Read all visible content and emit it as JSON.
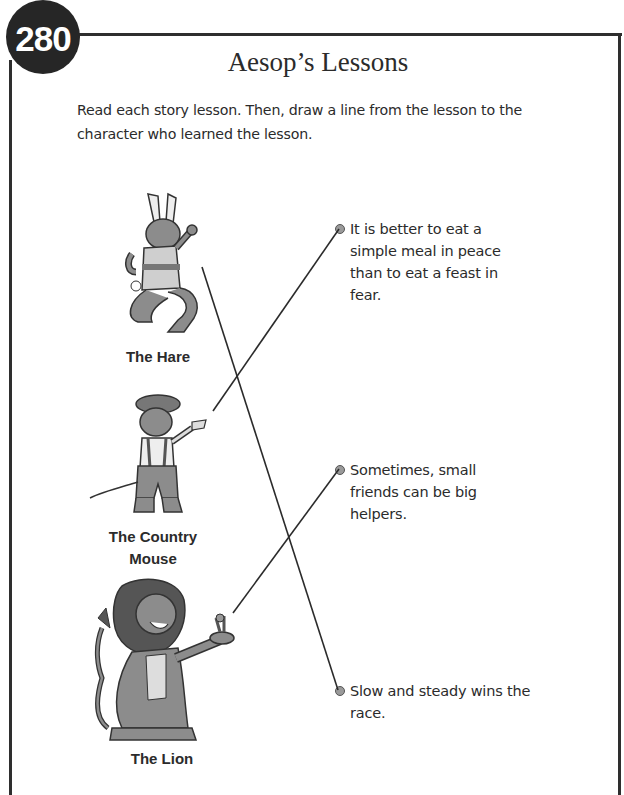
{
  "page": {
    "number": "280",
    "title": "Aesop’s Lessons",
    "instructions": "Read each story lesson. Then, draw a line from the lesson to the character who learned the lesson."
  },
  "characters": [
    {
      "label": "The Hare",
      "icon": "hare-illustration-icon"
    },
    {
      "label_line1": "The Country",
      "label_line2": "Mouse",
      "icon": "country-mouse-illustration-icon"
    },
    {
      "label": "The Lion",
      "icon": "lion-illustration-icon"
    }
  ],
  "lessons": [
    {
      "text": "It is better to eat a simple meal in peace than to eat a feast in fear.",
      "matched_to": "The Country Mouse"
    },
    {
      "text": "Sometimes, small friends can be big helpers.",
      "matched_to": "The Lion"
    },
    {
      "text": "Slow and steady wins the race.",
      "matched_to": "The Hare"
    }
  ],
  "colors": {
    "ink": "#2b2b2b",
    "badge": "#262626",
    "art_fill": "#8c8c8c"
  }
}
